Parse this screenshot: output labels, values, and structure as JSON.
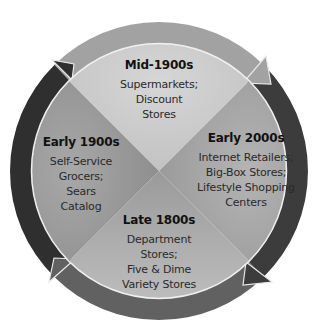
{
  "diagram": {
    "type": "cycle",
    "center": [
      159,
      171
    ],
    "sectors": [
      {
        "id": "top",
        "era": "Mid-1900s",
        "description": "Supermarkets;\nDiscount\nStores",
        "color": "#cbcbcb"
      },
      {
        "id": "right",
        "era": "Early 2000s",
        "description": "Internet Retailers;\nBig-Box Stores;\nLifestyle Shopping\nCenters",
        "color": "#a6a6a6"
      },
      {
        "id": "bottom",
        "era": "Late 1800s",
        "description": "Department\nStores;\nFive & Dime\nVariety Stores",
        "color": "#adadad"
      },
      {
        "id": "left",
        "era": "Early 1900s",
        "description": "Self-Service\nGrocers;\nSears\nCatalog",
        "color": "#9c9c9c"
      }
    ],
    "ring_arrows": [
      {
        "id": "top-arrow",
        "direction": "clockwise",
        "from": "Early 1900s",
        "to": "Mid-1900s",
        "color": "#a2a2a2"
      },
      {
        "id": "right-arrow",
        "direction": "clockwise",
        "from": "Mid-1900s",
        "to": "Early 2000s",
        "color": "#3c3c3c"
      },
      {
        "id": "bottom-arrow",
        "direction": "clockwise",
        "from": "Early 2000s",
        "to": "Late 1800s",
        "color": "#616161"
      },
      {
        "id": "left-arrow",
        "direction": "clockwise",
        "from": "Late 1800s",
        "to": "Early 1900s",
        "color": "#2f2f2f"
      }
    ]
  }
}
